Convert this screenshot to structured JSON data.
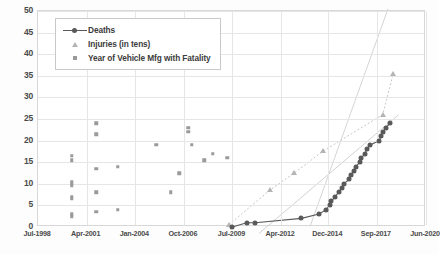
{
  "chart_data": {
    "type": "scatter",
    "title": "",
    "xlabel": "",
    "ylabel": "",
    "ylim": [
      0,
      50
    ],
    "yticks": [
      0,
      5,
      10,
      15,
      20,
      25,
      30,
      35,
      40,
      45,
      50
    ],
    "xticks": [
      "Jul-1998",
      "Apr-2001",
      "Jan-2004",
      "Oct-2006",
      "Jul-2009",
      "Apr-2012",
      "Dec-2014",
      "Sep-2017",
      "Jun-2020"
    ],
    "xlim_labels": [
      "Jul-1998",
      "Jun-2020"
    ],
    "grid": true,
    "legend_position": "top-left",
    "colors": {
      "deaths": "#595959",
      "injuries": "#b4b4b4",
      "vehicle_year": "#9a9a9a",
      "gridline": "#e6e6e6",
      "plot_border": "#d8d8d8",
      "background": "#ffffff"
    },
    "series": [
      {
        "name": "Deaths",
        "marker": "circle-line",
        "color": "#595959",
        "points": [
          {
            "x": 2009.5,
            "y": 0
          },
          {
            "x": 2010.3,
            "y": 1
          },
          {
            "x": 2010.8,
            "y": 1
          },
          {
            "x": 2013.4,
            "y": 2
          },
          {
            "x": 2014.4,
            "y": 3
          },
          {
            "x": 2014.8,
            "y": 4
          },
          {
            "x": 2015.0,
            "y": 5
          },
          {
            "x": 2015.1,
            "y": 6
          },
          {
            "x": 2015.3,
            "y": 7
          },
          {
            "x": 2015.5,
            "y": 8
          },
          {
            "x": 2015.7,
            "y": 9
          },
          {
            "x": 2015.8,
            "y": 10
          },
          {
            "x": 2016.1,
            "y": 11
          },
          {
            "x": 2016.2,
            "y": 12
          },
          {
            "x": 2016.4,
            "y": 13
          },
          {
            "x": 2016.5,
            "y": 14
          },
          {
            "x": 2016.7,
            "y": 15
          },
          {
            "x": 2016.8,
            "y": 16
          },
          {
            "x": 2017.0,
            "y": 17
          },
          {
            "x": 2017.1,
            "y": 18
          },
          {
            "x": 2017.3,
            "y": 19
          },
          {
            "x": 2017.8,
            "y": 20
          },
          {
            "x": 2017.9,
            "y": 21
          },
          {
            "x": 2018.0,
            "y": 22
          },
          {
            "x": 2018.2,
            "y": 23
          },
          {
            "x": 2018.4,
            "y": 24
          }
        ]
      },
      {
        "name": "Injuries (in tens)",
        "marker": "triangle",
        "color": "#b4b4b4",
        "points": [
          {
            "x": 2009.3,
            "y": 0.5
          },
          {
            "x": 2011.6,
            "y": 8.5
          },
          {
            "x": 2013.0,
            "y": 12.5
          },
          {
            "x": 2014.6,
            "y": 17.5
          },
          {
            "x": 2018.0,
            "y": 26.0
          },
          {
            "x": 2018.6,
            "y": 35.5
          }
        ]
      },
      {
        "name": "Year of Vehicle Mfg with Fatality",
        "marker": "square",
        "color": "#9a9a9a",
        "points": [
          {
            "x": 2000.4,
            "y": 16.5
          },
          {
            "x": 2000.4,
            "y": 15.5
          },
          {
            "x": 2000.4,
            "y": 10.5
          },
          {
            "x": 2000.4,
            "y": 10.0
          },
          {
            "x": 2000.4,
            "y": 9.5
          },
          {
            "x": 2000.4,
            "y": 7.0
          },
          {
            "x": 2000.4,
            "y": 6.5
          },
          {
            "x": 2000.4,
            "y": 3.0
          },
          {
            "x": 2000.4,
            "y": 2.5
          },
          {
            "x": 2001.8,
            "y": 24.0
          },
          {
            "x": 2001.8,
            "y": 21.5
          },
          {
            "x": 2001.8,
            "y": 13.5
          },
          {
            "x": 2001.8,
            "y": 8.0
          },
          {
            "x": 2001.8,
            "y": 3.5
          },
          {
            "x": 2003.0,
            "y": 14.0
          },
          {
            "x": 2003.0,
            "y": 4.0
          },
          {
            "x": 2005.2,
            "y": 19.0
          },
          {
            "x": 2006.5,
            "y": 12.5
          },
          {
            "x": 2006.0,
            "y": 8.0
          },
          {
            "x": 2007.0,
            "y": 23.0
          },
          {
            "x": 2007.0,
            "y": 22.0
          },
          {
            "x": 2007.2,
            "y": 19.0
          },
          {
            "x": 2007.9,
            "y": 15.5
          },
          {
            "x": 2008.4,
            "y": 17.0
          },
          {
            "x": 2009.2,
            "y": 16.0
          }
        ]
      }
    ],
    "legend": [
      {
        "label": "Deaths",
        "marker": "circle-line"
      },
      {
        "label": "Injuries (in tens)",
        "marker": "triangle"
      },
      {
        "label": "Year of Vehicle Mfg with Fatality",
        "marker": "square"
      }
    ]
  }
}
